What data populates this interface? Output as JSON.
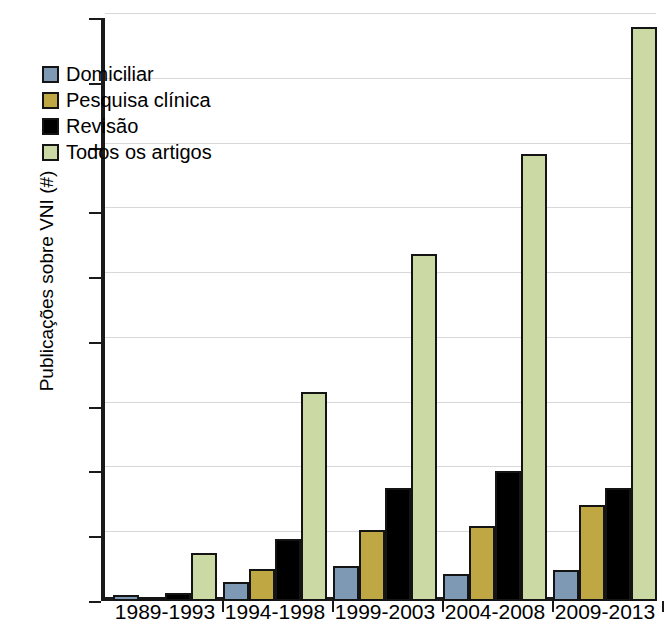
{
  "chart_data": {
    "type": "bar",
    "title": "",
    "subtitle": "",
    "xlabel": "",
    "ylabel": "Publicações sobre VNI (#)",
    "categories": [
      "1989-1993",
      "1994-1998",
      "1999-2003",
      "2004-2008",
      "2009-2013"
    ],
    "series": [
      {
        "name": "Domiciliar",
        "color": "#7d99b3",
        "values": [
          5,
          15,
          27,
          21,
          24
        ]
      },
      {
        "name": "Pesquisa clínica",
        "color": "#bfa843",
        "values": [
          3,
          25,
          55,
          58,
          74
        ]
      },
      {
        "name": "Revisão",
        "color": "#000000",
        "values": [
          6,
          48,
          87,
          100,
          87
        ]
      },
      {
        "name": "Todos os artigos",
        "color": "#cbd9a5",
        "values": [
          37,
          161,
          268,
          345,
          443
        ]
      }
    ],
    "ylim": [
      0,
      450
    ],
    "yticks": [
      0,
      50,
      100,
      150,
      200,
      250,
      300,
      350,
      400,
      450
    ],
    "ytick_labels": [
      "0",
      "50",
      "100",
      "150",
      "200",
      "250",
      "300",
      "350",
      "400",
      "450"
    ],
    "grid": true,
    "legend_position": "upper-left"
  },
  "legend": {
    "items": [
      {
        "label": "Domiciliar",
        "color": "#7d99b3"
      },
      {
        "label": "Pesquisa clínica",
        "color": "#bfa843"
      },
      {
        "label": "Revisão",
        "color": "#000000"
      },
      {
        "label": "Todos os artigos",
        "color": "#cbd9a5"
      }
    ]
  }
}
